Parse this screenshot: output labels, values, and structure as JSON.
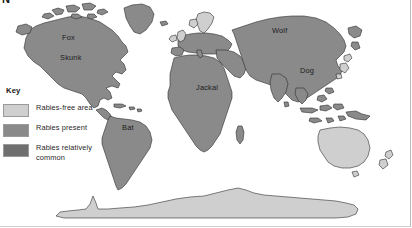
{
  "figure": {
    "title_partial": "N",
    "background_color": "#ffffff"
  },
  "key": {
    "heading": "Key",
    "entries": [
      {
        "label": "Rabies-free area",
        "color": "#cfcfcf",
        "name": "rabies-free"
      },
      {
        "label": "Rabies present",
        "color": "#8a8a8a",
        "name": "rabies-present"
      },
      {
        "label": "Rabies relatively common",
        "color": "#6f6f6f",
        "name": "rabies-common"
      }
    ]
  },
  "map": {
    "labels": [
      {
        "text": "Fox",
        "x": 62,
        "y": 40
      },
      {
        "text": "Skunk",
        "x": 60,
        "y": 60
      },
      {
        "text": "Bat",
        "x": 122,
        "y": 130
      },
      {
        "text": "Jackal",
        "x": 196,
        "y": 90
      },
      {
        "text": "Wolf",
        "x": 272,
        "y": 33
      },
      {
        "text": "Dog",
        "x": 300,
        "y": 73
      }
    ],
    "regions": [
      {
        "name": "north-america",
        "category": "rabies-present"
      },
      {
        "name": "greenland",
        "category": "rabies-present"
      },
      {
        "name": "south-america",
        "category": "rabies-present"
      },
      {
        "name": "africa",
        "category": "rabies-present"
      },
      {
        "name": "europe",
        "category": "rabies-present"
      },
      {
        "name": "scandinavia",
        "category": "rabies-free"
      },
      {
        "name": "british-isles",
        "category": "rabies-free"
      },
      {
        "name": "asia",
        "category": "rabies-present"
      },
      {
        "name": "japan",
        "category": "rabies-free"
      },
      {
        "name": "australia",
        "category": "rabies-free"
      },
      {
        "name": "new-zealand",
        "category": "rabies-free"
      },
      {
        "name": "antarctica",
        "category": "rabies-free"
      }
    ]
  }
}
